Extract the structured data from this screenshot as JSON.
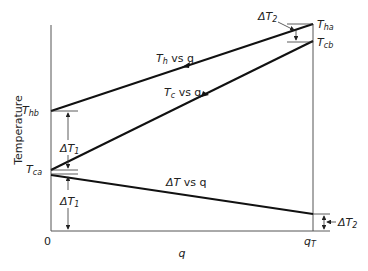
{
  "figure": {
    "y_axis_label": "Temperature",
    "x_axis_label": "q",
    "x_origin_label": "0",
    "x_end_label": {
      "main": "q",
      "sub": "T"
    },
    "points": {
      "T_hb": {
        "main": "T",
        "sub": "hb"
      },
      "T_ha": {
        "main": "T",
        "sub": "ha"
      },
      "T_ca": {
        "main": "T",
        "sub": "ca"
      },
      "T_cb": {
        "main": "T",
        "sub": "cb"
      }
    },
    "curves": [
      {
        "id": "hot",
        "label_main": "T",
        "label_sub": "h",
        "label_rest": " vs q",
        "from": "T_hb",
        "to": "T_ha",
        "arrow_direction": "toward q=0"
      },
      {
        "id": "cold",
        "label_main": "T",
        "label_sub": "c",
        "label_rest": " vs q",
        "from": "T_ca",
        "to": "T_cb",
        "arrow_direction": "toward q_T"
      },
      {
        "id": "delta",
        "label_main": "ΔT",
        "label_sub": "",
        "label_rest": " vs q",
        "from": "ΔT_1",
        "to": "ΔT_2"
      }
    ],
    "dimensions": {
      "dT1_upper": {
        "main": "ΔT",
        "sub": "1"
      },
      "dT1_lower": {
        "main": "ΔT",
        "sub": "1"
      },
      "dT2_left": {
        "main": "ΔT",
        "sub": "2"
      },
      "dT2_right": {
        "main": "ΔT",
        "sub": "2"
      }
    }
  }
}
